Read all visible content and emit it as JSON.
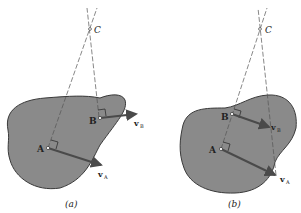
{
  "figures": [
    {
      "caption": "(a)",
      "points": {
        "A": "A",
        "B": "B",
        "C": "C"
      },
      "vectors": {
        "vA": "v",
        "vA_sub": "A",
        "vB": "v",
        "vB_sub": "B"
      }
    },
    {
      "caption": "(b)",
      "points": {
        "A": "A",
        "B": "B",
        "C": "C"
      },
      "vectors": {
        "vA": "v",
        "vA_sub": "A",
        "vB": "v",
        "vB_sub": "B"
      }
    }
  ],
  "colors": {
    "body_fill": "#8a8a8a",
    "body_stroke": "#3a3a3a",
    "arrow": "#4a4a4a",
    "line": "#555555"
  }
}
